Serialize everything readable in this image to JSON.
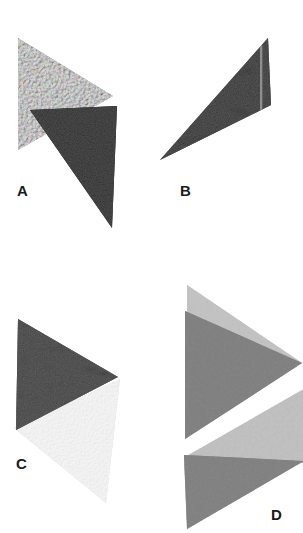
{
  "figure": {
    "background_color": "#ffffff",
    "width": 303,
    "height": 533,
    "layout": "2x2 panel plate",
    "panel_count": 4
  },
  "panels": [
    {
      "id": "A",
      "label": "A",
      "label_color": "#1a1a1a",
      "shape_count": 2,
      "shapes": [
        {
          "name": "upper-triangle",
          "orientation": "right-pointing",
          "texture": "bubble-foam",
          "tone": "light-gray",
          "fill_color": "#b0b0b0",
          "points": "18,38 113,96 18,150"
        },
        {
          "name": "lower-triangle",
          "orientation": "right-pointing",
          "texture": "dark-speckle",
          "tone": "near-black",
          "fill_color": "#121212",
          "points": "30,110 117,106 112,228"
        }
      ]
    },
    {
      "id": "B",
      "label": "B",
      "label_color": "#1a1a1a",
      "shape_count": 1,
      "shapes": [
        {
          "name": "single-triangle",
          "orientation": "left-pointing",
          "texture": "mottled-grain",
          "tone": "dark-gray",
          "fill_color": "#3a3a3a",
          "points": "119,105 8,160 116,38",
          "seam": "light vertical seam near right edge"
        }
      ]
    },
    {
      "id": "C",
      "label": "C",
      "label_color": "#1a1a1a",
      "shape_count": 2,
      "shapes": [
        {
          "name": "upper-triangle",
          "orientation": "right-pointing",
          "texture": "mottled-grain",
          "tone": "dark-gray",
          "fill_color": "#3d3d3d",
          "points": "18,52 118,110 16,163"
        },
        {
          "name": "lower-triangle",
          "orientation": "right-pointing",
          "texture": "fine-bubble",
          "tone": "very-light-gray",
          "fill_color": "#d8d8d8",
          "points": "14,161 120,112 106,236"
        }
      ]
    },
    {
      "id": "D",
      "label": "D",
      "label_color": "#1a1a1a",
      "shape_count": 4,
      "shapes": [
        {
          "name": "group1-upper-triangle",
          "orientation": "right-pointing",
          "texture": "coarse-grain",
          "tone": "light-gray",
          "fill_color": "#b8b8b8",
          "points": "35,18 148,10 35,48"
        },
        {
          "name": "group1-lower-triangle",
          "orientation": "right-pointing",
          "texture": "coarse-grain-dark",
          "tone": "medium-gray",
          "fill_color": "#8a8a8a",
          "points": "33,44 150,96 33,172"
        },
        {
          "name": "group2-upper-triangle",
          "orientation": "right-pointing",
          "texture": "coarse-grain",
          "tone": "light-gray",
          "fill_color": "#b4b4b4",
          "points": "33,190 152,122 152,196"
        },
        {
          "name": "group2-lower-triangle",
          "orientation": "right-pointing",
          "texture": "coarse-grain-dark",
          "tone": "medium-gray",
          "fill_color": "#8e8e8e",
          "points": "32,188 152,194 35,262"
        }
      ]
    }
  ]
}
